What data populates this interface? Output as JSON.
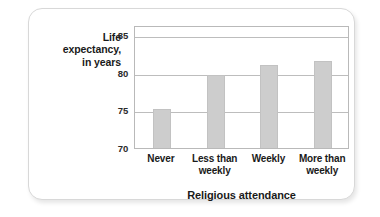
{
  "chart_data": {
    "type": "bar",
    "title": "",
    "subtitle": "",
    "xlabel": "Religious attendance",
    "ylabel": "Life expectancy,\nin years",
    "ylabel_lines": [
      "Life",
      "expectancy,",
      "in years"
    ],
    "categories": [
      "Never",
      "Less than weekly",
      "Weekly",
      "More than weekly"
    ],
    "category_lines": [
      [
        "Never"
      ],
      [
        "Less than",
        "weekly"
      ],
      [
        "Weekly"
      ],
      [
        "More than",
        "weekly"
      ]
    ],
    "values": [
      75.2,
      79.7,
      81.0,
      81.5
    ],
    "ylim": [
      70,
      86.3
    ],
    "yticks": [
      70,
      75,
      80,
      85
    ],
    "ytick_labels": [
      "70",
      "75",
      "80",
      "85"
    ],
    "grid": true,
    "grid_axis": "y",
    "legend": false,
    "bar_color": "#cdcdcd",
    "bar_edge_color": "#c2c2c2",
    "grid_color": "#bdbdbd",
    "frame_color": "#b9b9b9",
    "text_color": "#1a1a1a",
    "background_color": "#ffffff"
  }
}
